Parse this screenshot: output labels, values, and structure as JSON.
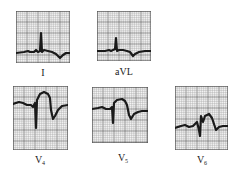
{
  "figure": {
    "leads": [
      {
        "id": "I",
        "label": "I",
        "sub": "",
        "box": {
          "x": 16,
          "y": 11,
          "w": 54,
          "h": 52
        },
        "label_pos": {
          "x": 43,
          "y": 68
        },
        "trace": "M0,42 L8,41 L12,40 L14,41 L18,41 L20,39 L22,41 L24,40 L25,22 L26,41 L28,39 L32,40 L36,41 L40,43 L44,47 L47,44 L50,42 L54,42"
      },
      {
        "id": "aVL",
        "label": "aVL",
        "sub": "",
        "box": {
          "x": 97,
          "y": 11,
          "w": 54,
          "h": 50
        },
        "label_pos": {
          "x": 124,
          "y": 67
        },
        "trace": "M0,40 L8,40 L12,39 L14,40 L16,39 L18,38 L19,27 L20,40 L22,39 L26,39 L30,40 L33,41 L36,45 L38,43 L42,41 L48,40 L54,40"
      },
      {
        "id": "V4",
        "label": "V",
        "sub": "4",
        "box": {
          "x": 13,
          "y": 86,
          "w": 55,
          "h": 64
        },
        "label_pos": {
          "x": 40,
          "y": 155
        },
        "trace": "M0,18 L6,16 L10,17 L14,19 L18,19 L20,21 L22,17 L23,42 L24,14 L27,8 L31,6 L35,8 L37,12 L38,24 L40,33 L42,30 L45,24 L49,20 L55,19"
      },
      {
        "id": "V5",
        "label": "V",
        "sub": "5",
        "box": {
          "x": 92,
          "y": 87,
          "w": 56,
          "h": 56
        },
        "label_pos": {
          "x": 123,
          "y": 153
        },
        "trace": "M0,22 L6,21 L10,20 L14,22 L18,22 L20,20 L21,36 L22,16 L25,13 L30,12 L33,14 L35,18 L37,28 L39,32 L42,27 L46,25 L50,24 L56,24"
      },
      {
        "id": "V6",
        "label": "V",
        "sub": "6",
        "box": {
          "x": 175,
          "y": 86,
          "w": 53,
          "h": 64
        },
        "label_pos": {
          "x": 202,
          "y": 155
        },
        "trace": "M0,42 L6,40 L10,39 L14,41 L18,40 L20,38 L22,36 L24,44 L25,50 L26,30 L28,36 L30,30 L34,28 L37,32 L39,38 L41,44 L44,41 L48,40 L53,40"
      }
    ]
  },
  "colors": {
    "grid_minor": "#9a9a9a",
    "grid_major": "#555555",
    "paper": "#f4f4f4",
    "trace": "#1a1a1a",
    "label": "#222222"
  }
}
